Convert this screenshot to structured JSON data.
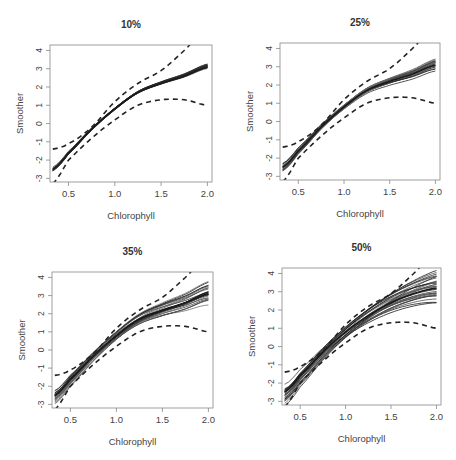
{
  "chart_data": [
    {
      "type": "line",
      "title": "10%",
      "xlabel": "Chlorophyll",
      "ylabel": "Smoother",
      "xlim": [
        0.3,
        2.05
      ],
      "ylim": [
        -3.2,
        4.3
      ],
      "xticks": [
        "0.5",
        "1.0",
        "1.5",
        "2.0"
      ],
      "yticks": [
        "-3",
        "-2",
        "-1",
        "0",
        "1",
        "2",
        "3",
        "4"
      ],
      "grid": false,
      "x": [
        0.33,
        0.5,
        0.75,
        1.0,
        1.25,
        1.5,
        1.75,
        2.0
      ],
      "band_upper": [
        -1.4,
        -1.1,
        -0.2,
        1.2,
        2.2,
        2.9,
        4.0,
        5.2
      ],
      "band_lower": [
        -3.3,
        -2.0,
        -0.8,
        0.2,
        1.0,
        1.3,
        1.3,
        1.0
      ],
      "center": [
        -2.5,
        -1.6,
        -0.3,
        0.8,
        1.7,
        2.2,
        2.6,
        3.1
      ],
      "spread": 0.2,
      "n_lines": 20
    },
    {
      "type": "line",
      "title": "25%",
      "xlabel": "Chlorophyll",
      "ylabel": "Smoother",
      "xlim": [
        0.3,
        2.05
      ],
      "ylim": [
        -3.2,
        4.3
      ],
      "xticks": [
        "0.5",
        "1.0",
        "1.5",
        "2.0"
      ],
      "yticks": [
        "-3",
        "-2",
        "-1",
        "0",
        "1",
        "2",
        "3",
        "4"
      ],
      "grid": false,
      "x": [
        0.33,
        0.5,
        0.75,
        1.0,
        1.25,
        1.5,
        1.75,
        2.0
      ],
      "band_upper": [
        -1.4,
        -1.1,
        -0.2,
        1.2,
        2.2,
        2.9,
        4.0,
        5.2
      ],
      "band_lower": [
        -3.3,
        -2.0,
        -0.8,
        0.2,
        1.0,
        1.3,
        1.3,
        1.0
      ],
      "center": [
        -2.5,
        -1.6,
        -0.3,
        0.8,
        1.7,
        2.2,
        2.6,
        3.1
      ],
      "spread": 0.45,
      "n_lines": 20
    },
    {
      "type": "line",
      "title": "35%",
      "xlabel": "Chlorophyll",
      "ylabel": "Smoother",
      "xlim": [
        0.3,
        2.05
      ],
      "ylim": [
        -3.2,
        4.3
      ],
      "xticks": [
        "0.5",
        "1.0",
        "1.5",
        "2.0"
      ],
      "yticks": [
        "-3",
        "-2",
        "-1",
        "0",
        "1",
        "2",
        "3",
        "4"
      ],
      "grid": false,
      "x": [
        0.33,
        0.5,
        0.75,
        1.0,
        1.25,
        1.5,
        1.75,
        2.0
      ],
      "band_upper": [
        -1.4,
        -1.1,
        -0.2,
        1.2,
        2.2,
        2.9,
        4.0,
        5.2
      ],
      "band_lower": [
        -3.3,
        -2.0,
        -0.8,
        0.2,
        1.0,
        1.3,
        1.3,
        1.0
      ],
      "center": [
        -2.5,
        -1.6,
        -0.3,
        0.8,
        1.7,
        2.2,
        2.6,
        3.1
      ],
      "spread": 0.9,
      "n_lines": 25
    },
    {
      "type": "line",
      "title": "50%",
      "xlabel": "Chlorophyll",
      "ylabel": "Smoother",
      "xlim": [
        0.3,
        2.05
      ],
      "ylim": [
        -3.2,
        4.3
      ],
      "xticks": [
        "0.5",
        "1.0",
        "1.5",
        "2.0"
      ],
      "yticks": [
        "-3",
        "-2",
        "-1",
        "0",
        "1",
        "2",
        "3",
        "4"
      ],
      "grid": false,
      "x": [
        0.33,
        0.5,
        0.75,
        1.0,
        1.25,
        1.5,
        1.75,
        2.0
      ],
      "band_upper": [
        -1.4,
        -1.1,
        -0.2,
        1.2,
        2.2,
        2.9,
        4.0,
        5.2
      ],
      "band_lower": [
        -3.3,
        -2.0,
        -0.8,
        0.2,
        1.0,
        1.3,
        1.3,
        1.0
      ],
      "center": [
        -2.5,
        -1.6,
        -0.3,
        0.8,
        1.7,
        2.4,
        2.9,
        3.2
      ],
      "spread": 1.3,
      "n_lines": 30
    }
  ],
  "panels": [
    {
      "title": "10%",
      "xlabel": "Chlorophyll",
      "ylabel": "Smoother",
      "box": [
        50,
        45,
        212,
        182
      ]
    },
    {
      "title": "25%",
      "xlabel": "Chlorophyll",
      "ylabel": "Smoother",
      "box": [
        280,
        43,
        440,
        180
      ]
    },
    {
      "title": "35%",
      "xlabel": "Chlorophyll",
      "ylabel": "Smoother",
      "box": [
        52,
        272,
        213,
        408
      ]
    },
    {
      "title": "50%",
      "xlabel": "Chlorophyll",
      "ylabel": "Smoother",
      "box": [
        282,
        268,
        441,
        405
      ]
    }
  ],
  "colors": {
    "axis": "#888888",
    "text": "#444444",
    "title": "#333333",
    "line": "#1a1a1a",
    "band": "#222222"
  }
}
